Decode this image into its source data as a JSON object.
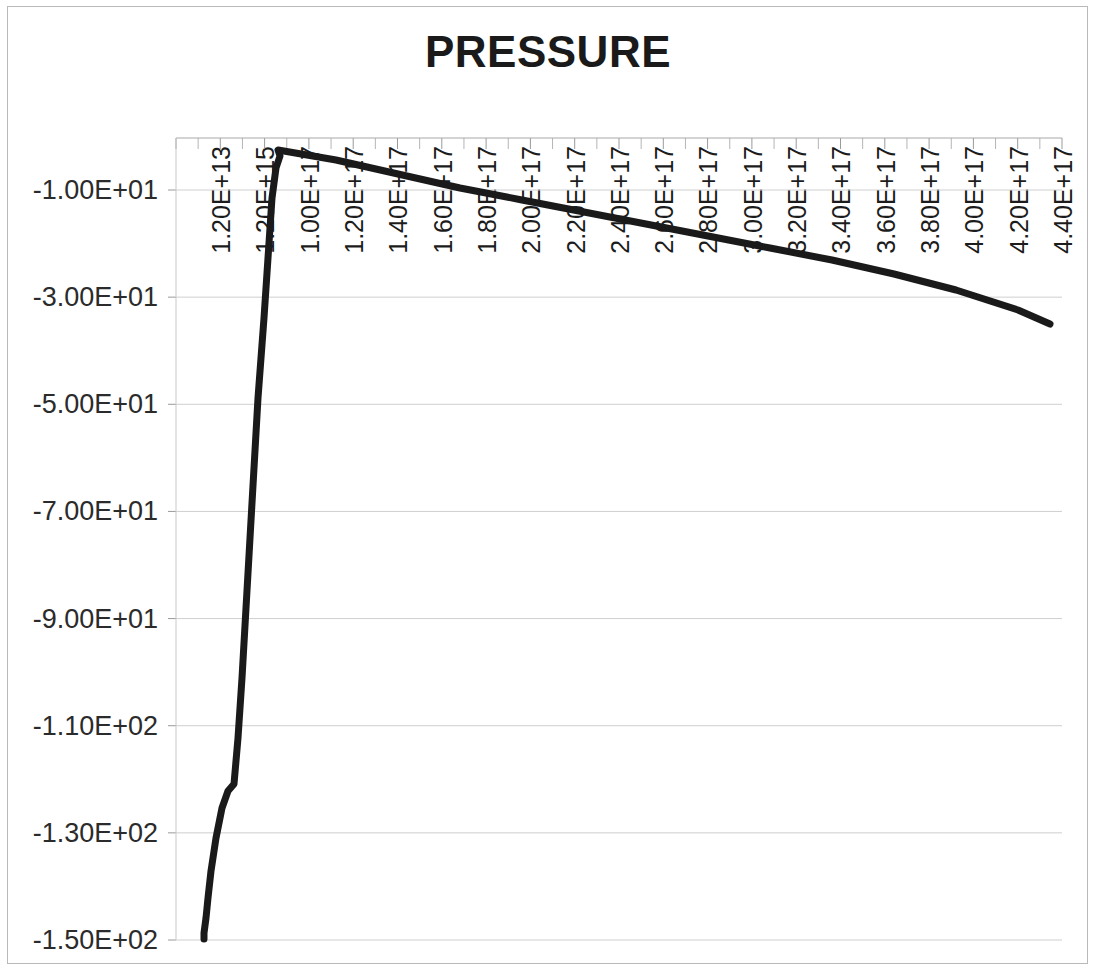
{
  "chart_data": {
    "type": "line",
    "title": "PRESSURE",
    "xlabel": "",
    "ylabel": "",
    "grid": "horizontal",
    "legend": false,
    "series_color": "#1a1a1a",
    "line_width_px": 7,
    "ylim": [
      -150,
      0
    ],
    "yticks": [
      -10,
      -30,
      -50,
      -70,
      -90,
      -110,
      -130,
      -150
    ],
    "ytick_labels": [
      "-1.00E+01",
      "-3.00E+01",
      "-5.00E+01",
      "-7.00E+01",
      "-9.00E+01",
      "-1.10E+02",
      "-1.30E+02",
      "-1.50E+02"
    ],
    "xtick_labels": [
      "1.20E+13",
      "1.20E+15",
      "1.00E+17",
      "1.20E+17",
      "1.40E+17",
      "1.60E+17",
      "1.80E+17",
      "2.00E+17",
      "2.20E+17",
      "2.40E+17",
      "2.60E+17",
      "2.80E+17",
      "3.00E+17",
      "3.20E+17",
      "3.40E+17",
      "3.60E+17",
      "3.80E+17",
      "4.00E+17",
      "4.20E+17",
      "4.40E+17"
    ],
    "x_index": [
      0,
      1,
      2,
      3,
      4,
      5,
      6,
      7,
      8,
      9,
      10,
      11,
      12,
      13,
      14,
      15,
      16,
      17,
      18,
      19
    ],
    "series": [
      {
        "name": "PRESSURE",
        "values": [
          -150.0,
          -148.6,
          -132.5,
          -126.0,
          -114.0,
          -96.0,
          -78.0,
          -60.0,
          -42.0,
          -26.0,
          -12.5,
          -3.0,
          -4.0,
          -6.0,
          -8.0,
          -10.2,
          -12.0,
          -13.5,
          -15.0,
          -16.4,
          -17.8,
          -19.2,
          -20.6,
          -22.0,
          -23.6,
          -25.4,
          -27.6,
          -30.2,
          -33.2,
          -36.3,
          -38.9
        ]
      }
    ],
    "curve_points_px": [
      [
        28,
        801
      ],
      [
        28,
        795
      ],
      [
        30,
        780
      ],
      [
        32,
        760
      ],
      [
        35,
        733
      ],
      [
        40,
        700
      ],
      [
        46,
        670
      ],
      [
        52,
        653
      ],
      [
        58,
        646
      ],
      [
        62,
        600
      ],
      [
        66,
        540
      ],
      [
        70,
        470
      ],
      [
        74,
        400
      ],
      [
        78,
        330
      ],
      [
        82,
        260
      ],
      [
        88,
        180
      ],
      [
        92,
        120
      ],
      [
        96,
        60
      ],
      [
        100,
        30
      ],
      [
        104,
        18
      ],
      [
        102,
        12
      ],
      [
        160,
        22
      ],
      [
        222,
        36
      ],
      [
        284,
        50
      ],
      [
        346,
        62
      ],
      [
        408,
        74
      ],
      [
        470,
        86
      ],
      [
        532,
        98
      ],
      [
        594,
        110
      ],
      [
        656,
        122
      ],
      [
        718,
        136
      ],
      [
        780,
        152
      ],
      [
        842,
        172
      ],
      [
        874,
        186
      ]
    ]
  },
  "axis": {
    "top_ticks_count": 20,
    "minor_ticks_per_major": 1
  }
}
